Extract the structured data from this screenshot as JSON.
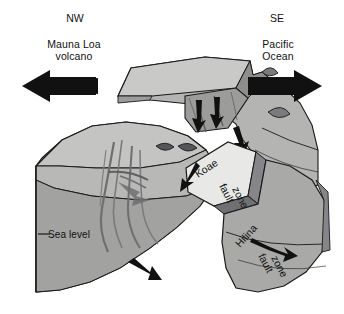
{
  "figure": {
    "type": "geologic-block-diagram",
    "background_color": "#ffffff",
    "line_color": "#1a1a1a"
  },
  "compass": {
    "left": "NW",
    "right": "SE"
  },
  "annotations": {
    "northwest_feature": "Mauna Loa\nvolcano",
    "southeast_feature": "Pacific\nOcean",
    "sea_level": "Sea level"
  },
  "fault_zones": [
    {
      "id": "koae",
      "label": "Koae\nfault\nzone",
      "line1": "Koae",
      "line2": "fault",
      "line3": "zone",
      "fill": "#e8e8e6"
    },
    {
      "id": "hilina",
      "label": "Hilina\nfault\nzone",
      "line1": "Hilina",
      "line2": "fault",
      "line3": "zone",
      "fill": "#a9a9a7"
    }
  ],
  "motion_arrows": {
    "northwest": "left-arrow",
    "southeast": "right-arrow",
    "fault_slip": "slip-arrow"
  },
  "palette": {
    "top_surface": "#c9c9c7",
    "upper_block": "#b4b4b2",
    "cut_face": "#9c9c9a",
    "deep_face": "#8e8e8c",
    "light_wedge": "#e8e8e6",
    "shadow": "#76767a",
    "outline": "#1a1a1a"
  }
}
